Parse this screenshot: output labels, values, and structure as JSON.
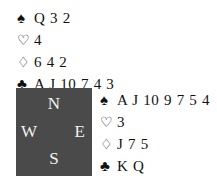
{
  "diagram": {
    "type": "bridge-hand-diagram",
    "background_color": "#ffffff",
    "text_color": "#111111"
  },
  "compass": {
    "box_color": "#4a4a4a",
    "label_color": "#f2f2f2",
    "north": "N",
    "west": "W",
    "east": "E",
    "south": "S"
  },
  "suit_symbols": {
    "spade": "♠",
    "heart": "♡",
    "diamond": "♢",
    "club": "♣"
  },
  "hands": {
    "north": {
      "position_label": "North",
      "spades": "Q 3 2",
      "hearts": "4",
      "diamonds": "6 4 2",
      "clubs": "A J 10 7 4 3"
    },
    "east": {
      "position_label": "East",
      "spades": "A J 10 9 7 5 4",
      "hearts": "3",
      "diamonds": "J 7 5",
      "clubs": "K Q"
    }
  }
}
